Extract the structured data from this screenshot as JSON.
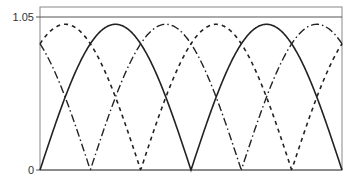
{
  "chart_data": {
    "type": "line",
    "title": "",
    "xlabel": "",
    "ylabel": "",
    "ylim": [
      0,
      1.05
    ],
    "yticks": [
      0,
      1.05
    ],
    "ytick_labels": [
      "0",
      "1.05"
    ],
    "xticks": [],
    "grid": false,
    "legend": null,
    "x_range_periods": [
      0,
      2
    ],
    "series": [
      {
        "name": "|sin(x)|",
        "style": "solid",
        "phase": 0,
        "amplitude": 1.0,
        "color": "#222222"
      },
      {
        "name": "|sin(x - 2π/3)|",
        "style": "dashed",
        "phase": 0.6667,
        "amplitude": 1.0,
        "color": "#222222"
      },
      {
        "name": "|sin(x + 2π/3)|",
        "style": "dash-dot",
        "phase": -0.6667,
        "amplitude": 1.0,
        "color": "#222222"
      }
    ],
    "sample_points": {
      "x_fraction_of_period": [
        0,
        0.1667,
        0.3333,
        0.5,
        0.6667,
        0.8333,
        1.0,
        1.1667,
        1.3333,
        1.5,
        1.6667,
        1.8333,
        2.0
      ],
      "solid": [
        0,
        0.5,
        0.87,
        1.0,
        0.87,
        0.5,
        0,
        0.5,
        0.87,
        1.0,
        0.87,
        0.5,
        0
      ],
      "dashed": [
        0.87,
        0.5,
        0,
        0.5,
        0.87,
        1.0,
        0.87,
        0.5,
        0,
        0.5,
        0.87,
        1.0,
        0.87
      ],
      "dashdot": [
        0.87,
        1.0,
        0.87,
        0.5,
        0,
        0.5,
        0.87,
        1.0,
        0.87,
        0.5,
        0,
        0.5,
        0.87
      ]
    }
  },
  "axes": {
    "y_top_label": "1.05",
    "y_bottom_label": "0"
  }
}
